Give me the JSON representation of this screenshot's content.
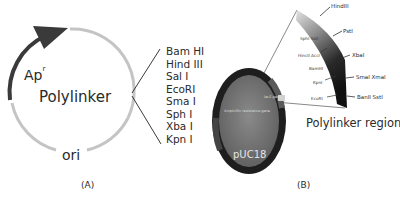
{
  "panel_a": {
    "caption": "(A)",
    "center_label": "Polylinker",
    "resistance_label": "Ap",
    "resistance_superscript": "r",
    "ori_label": "ori",
    "sites": [
      "Bam HI",
      "Hind III",
      "Sal I",
      "EcoRI",
      "Sma I",
      "Sph I",
      "Xba I",
      "Kpn I"
    ],
    "colors": {
      "ring": "#c4c4c4",
      "arrow": "#3a3a3a",
      "text": "#2a2a2a"
    }
  },
  "panel_b": {
    "caption": "(B)",
    "plasmid_name": "pUC18",
    "gene_label_1": "Ampicillin resistance gene",
    "gene_label_2": "lacZ gene",
    "region_title": "Polylinker region",
    "outer_sites": [
      "HindIII",
      "PstI",
      "XbaI",
      "SmaI XmaI",
      "BanII SstI"
    ],
    "inner_sites": [
      "SphI SalI",
      "HincII AccI",
      "BamHI",
      "KpnI",
      "EcoRI"
    ],
    "colors": {
      "oval_fill": "#7a7a7a",
      "oval_ring": "#1e1e1e",
      "fan_light": "#d8d8d8",
      "fan_dark": "#1a1a1a"
    }
  }
}
